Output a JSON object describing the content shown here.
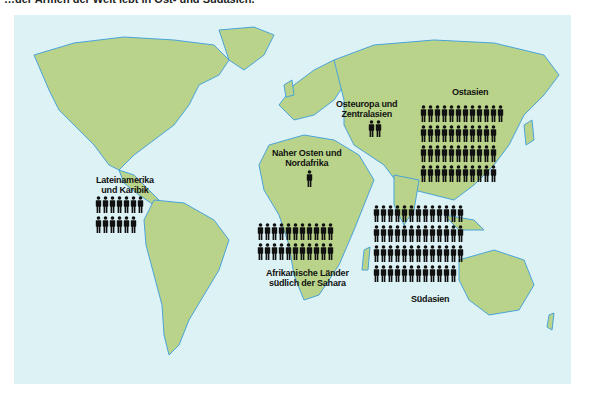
{
  "title": "…der Armen der Welt lebt in Ost- und Südasien.",
  "colors": {
    "ocean": "#dcf2f5",
    "land": "#b9d48a",
    "coast": "#4aa3d8",
    "figure": "#111111"
  },
  "unit_icon": "person-icon",
  "regions": [
    {
      "id": "lateinamerika",
      "label_lines": [
        "Lateinamerika",
        "und Karibik"
      ],
      "rows": [
        7,
        6
      ],
      "total": 13
    },
    {
      "id": "naher-osten",
      "label_lines": [
        "Naher Osten und",
        "Nordafrika"
      ],
      "rows": [
        1
      ],
      "total": 1
    },
    {
      "id": "osteuropa",
      "label_lines": [
        "Osteuropa und",
        "Zentralasien"
      ],
      "rows": [
        2
      ],
      "total": 2
    },
    {
      "id": "ostasien",
      "label_lines": [
        "Ostasien"
      ],
      "rows": [
        12,
        11,
        11,
        11
      ],
      "total": 45
    },
    {
      "id": "afrika",
      "label_lines": [
        "Afrikanische Länder",
        "südlich der Sahara"
      ],
      "rows": [
        11,
        11
      ],
      "total": 22
    },
    {
      "id": "suedasien",
      "label_lines": [
        "Südasien"
      ],
      "rows": [
        13,
        13,
        13,
        12
      ],
      "total": 51
    }
  ]
}
